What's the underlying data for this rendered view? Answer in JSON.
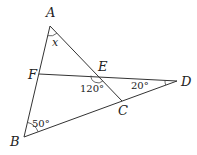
{
  "diagram": {
    "type": "geometry",
    "points": {
      "A": {
        "label": "A",
        "x": 50,
        "y": 26
      },
      "B": {
        "label": "B",
        "x": 24,
        "y": 137
      },
      "C": {
        "label": "C",
        "x": 122,
        "y": 101
      },
      "D": {
        "label": "D",
        "x": 177,
        "y": 81
      },
      "E": {
        "label": "E",
        "x": 98,
        "y": 76
      },
      "F": {
        "label": "F",
        "x": 39,
        "y": 74
      }
    },
    "segments": [
      "AB",
      "AC",
      "BD",
      "FD"
    ],
    "angles": {
      "A": "x",
      "E": "120°",
      "D": "20°",
      "B": "50°"
    },
    "colors": {
      "line": "#333333",
      "text": "#222222",
      "background": "#ffffff"
    }
  }
}
